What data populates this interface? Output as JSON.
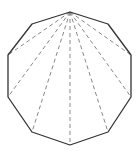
{
  "diagram": {
    "shape": "decagon",
    "sides": 10,
    "vertices": [
      [
        70,
        12
      ],
      [
        108,
        24
      ],
      [
        131,
        55
      ],
      [
        131,
        97
      ],
      [
        108,
        132
      ],
      [
        70,
        145
      ],
      [
        32,
        132
      ],
      [
        8,
        97
      ],
      [
        8,
        55
      ],
      [
        32,
        24
      ]
    ],
    "diagonals_from_vertex": 0,
    "diagonal_targets": [
      2,
      3,
      4,
      5,
      6,
      7,
      8
    ],
    "colors": {
      "edge": "#333333",
      "diagonal": "#888888",
      "background": "#ffffff"
    }
  }
}
